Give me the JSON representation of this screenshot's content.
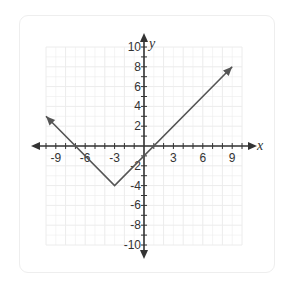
{
  "chart_data": {
    "type": "line",
    "title": "",
    "xlabel": "x",
    "ylabel": "y",
    "xlim": [
      -10,
      10
    ],
    "ylim": [
      -10,
      10
    ],
    "grid": true,
    "x_ticks": [
      -9,
      -6,
      -3,
      3,
      6,
      9
    ],
    "y_ticks": [
      10,
      8,
      6,
      4,
      2,
      -2,
      -4,
      -6,
      -8,
      -10
    ],
    "x_tick_labels": [
      "-9",
      "-6",
      "-3",
      "3",
      "6",
      "9"
    ],
    "y_tick_labels": [
      "10",
      "8",
      "6",
      "4",
      "2",
      "-2",
      "-4",
      "-6",
      "-8",
      "-10"
    ],
    "series": [
      {
        "name": "y = |x + 3| - 4",
        "x": [
          -10,
          -3,
          9
        ],
        "y": [
          3,
          -4,
          8
        ],
        "arrows": "both ends",
        "color": "#555555"
      }
    ]
  },
  "labels": {
    "x_axis": "x",
    "y_axis": "y"
  },
  "colors": {
    "axis": "#333333",
    "grid": "#ececec",
    "line": "#555555",
    "card_border": "#eeeeee"
  }
}
